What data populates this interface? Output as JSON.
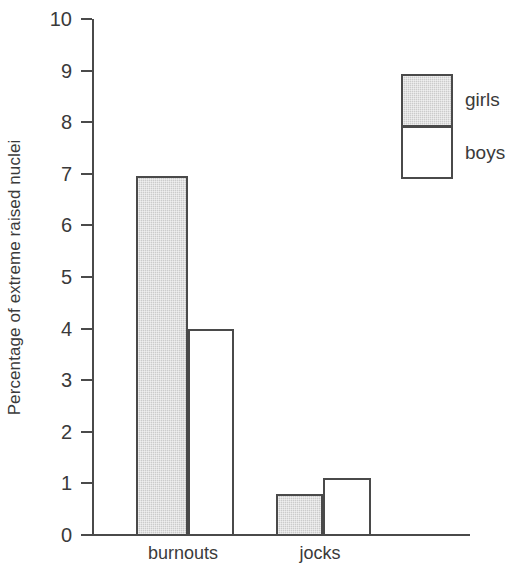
{
  "chart_data": {
    "type": "bar",
    "title": "",
    "xlabel": "",
    "ylabel": "Percentage of extreme raised nuclei",
    "categories": [
      "burnouts",
      "jocks"
    ],
    "series": [
      {
        "name": "girls",
        "values": [
          6.95,
          0.8
        ],
        "color": "#cbcbcb"
      },
      {
        "name": "boys",
        "values": [
          4.0,
          1.1
        ],
        "color": "#ffffff"
      }
    ],
    "ylim": [
      0,
      10
    ],
    "ytick_labels": [
      "10",
      "9",
      "8",
      "7",
      "6",
      "5",
      "4",
      "3",
      "2",
      "1",
      "0"
    ],
    "ytick_values": [
      10,
      9,
      8,
      7,
      6,
      5,
      4,
      3,
      2,
      1,
      0
    ],
    "grid": false,
    "legend_position": "top-right",
    "legend_entries": [
      "girls",
      "boys"
    ],
    "outline_color": "#4a4a4a",
    "background": "#ffffff"
  }
}
